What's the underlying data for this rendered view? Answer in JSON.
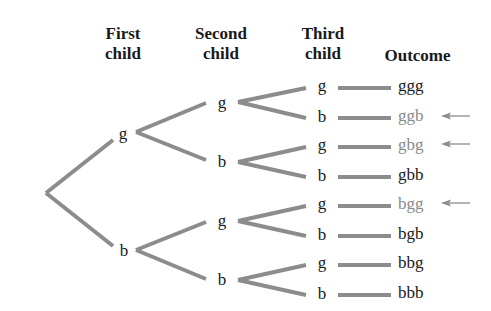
{
  "headers": {
    "first": [
      "First",
      "child"
    ],
    "second": [
      "Second",
      "child"
    ],
    "third": [
      "Third",
      "child"
    ],
    "outcome": "Outcome"
  },
  "tree": {
    "level1": [
      {
        "label": "g",
        "x": 122,
        "y": 136
      },
      {
        "label": "b",
        "x": 122,
        "y": 250
      }
    ],
    "level2": [
      {
        "label": "g",
        "x": 222,
        "y": 105
      },
      {
        "label": "b",
        "x": 222,
        "y": 163
      },
      {
        "label": "g",
        "x": 222,
        "y": 222
      },
      {
        "label": "b",
        "x": 222,
        "y": 280
      }
    ],
    "level3": [
      {
        "label": "g",
        "y": 87
      },
      {
        "label": "b",
        "y": 117
      },
      {
        "label": "g",
        "y": 146
      },
      {
        "label": "b",
        "y": 176
      },
      {
        "label": "g",
        "y": 205
      },
      {
        "label": "b",
        "y": 235
      },
      {
        "label": "g",
        "y": 264
      },
      {
        "label": "b",
        "y": 294
      }
    ]
  },
  "outcomes": [
    {
      "label": "ggg",
      "highlighted": false
    },
    {
      "label": "ggb",
      "highlighted": true
    },
    {
      "label": "gbg",
      "highlighted": true
    },
    {
      "label": "gbb",
      "highlighted": false
    },
    {
      "label": "bgg",
      "highlighted": true
    },
    {
      "label": "bgb",
      "highlighted": false
    },
    {
      "label": "bbg",
      "highlighted": false
    },
    {
      "label": "bbb",
      "highlighted": false
    }
  ],
  "colors": {
    "branch": "#8c8c8c",
    "text": "#1a1a1a",
    "highlight_text": "#8a8a8a",
    "arrow": "#8c8c8c"
  }
}
